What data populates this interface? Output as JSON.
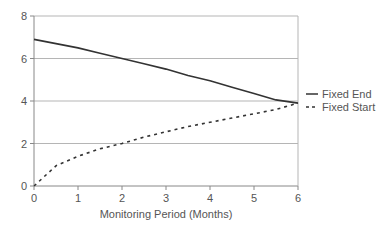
{
  "chart_data": {
    "type": "line",
    "title": "",
    "xlabel": "Monitoring Period (Months)",
    "ylabel": "",
    "xlim": [
      0,
      6
    ],
    "ylim": [
      0,
      8
    ],
    "xticks": [
      0,
      1,
      2,
      3,
      4,
      5,
      6
    ],
    "yticks": [
      0,
      2,
      4,
      6,
      8
    ],
    "grid": "horizontal",
    "legend_position": "right",
    "x": [
      0,
      0.5,
      1,
      1.5,
      2,
      2.5,
      3,
      3.5,
      4,
      4.5,
      5,
      5.5,
      6
    ],
    "series": [
      {
        "name": "Fixed End",
        "style": "solid",
        "color": "#333333",
        "values": [
          6.9,
          6.7,
          6.5,
          6.25,
          6.0,
          5.75,
          5.5,
          5.2,
          4.95,
          4.65,
          4.35,
          4.05,
          3.9
        ]
      },
      {
        "name": "Fixed Start",
        "style": "dashed",
        "color": "#333333",
        "values": [
          0,
          0.95,
          1.4,
          1.75,
          2.0,
          2.3,
          2.55,
          2.8,
          3.0,
          3.2,
          3.4,
          3.6,
          3.9
        ]
      }
    ]
  },
  "legend": {
    "items": [
      {
        "label": "Fixed End"
      },
      {
        "label": "Fixed Start"
      }
    ]
  },
  "axes": {
    "x_title": "Monitoring Period (Months)",
    "x_tick_labels": [
      "0",
      "1",
      "2",
      "3",
      "4",
      "5",
      "6"
    ],
    "y_tick_labels": [
      "0",
      "2",
      "4",
      "6",
      "8"
    ]
  }
}
